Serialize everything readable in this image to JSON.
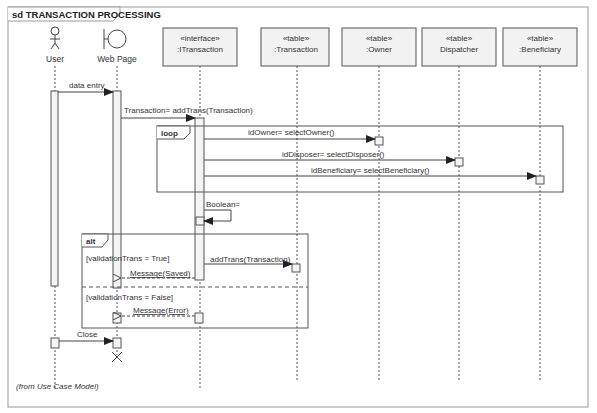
{
  "diagram": {
    "type": "UML sequence diagram",
    "frame_title": "sd TRANSACTION PROCESSING",
    "footer_note": "(from Use Case Model)",
    "participants": [
      {
        "id": "user",
        "kind": "actor",
        "label": "User"
      },
      {
        "id": "webpage",
        "kind": "boundary",
        "label": "Web Page"
      },
      {
        "id": "itransaction",
        "kind": "box",
        "stereotype": "«interface»",
        "label": ":ITransaction"
      },
      {
        "id": "transaction",
        "kind": "box",
        "stereotype": "«table»",
        "label": ":Transaction"
      },
      {
        "id": "owner",
        "kind": "box",
        "stereotype": "«table»",
        "label": ":Owner"
      },
      {
        "id": "dispatcher",
        "kind": "box",
        "stereotype": "«table»",
        "label": "Dispatcher"
      },
      {
        "id": "beneficiary",
        "kind": "box",
        "stereotype": "«table»",
        "label": ":Beneficiary"
      }
    ],
    "messages": [
      {
        "from": "User",
        "to": "Web Page",
        "label": "data entry",
        "style": "sync"
      },
      {
        "from": "Web Page",
        "to": ":ITransaction",
        "label": "Transaction= addTrans(Transaction)",
        "style": "sync"
      },
      {
        "from": ":ITransaction",
        "to": ":Owner",
        "label": "idOwner= selectOwner()",
        "style": "sync"
      },
      {
        "from": ":ITransaction",
        "to": "Dispatcher",
        "label": "idDisposer= selectDisposer()",
        "style": "sync"
      },
      {
        "from": ":ITransaction",
        "to": ":Beneficiary",
        "label": "idBeneficiary= selectBeneficiary()",
        "style": "sync"
      },
      {
        "from": ":ITransaction",
        "to": ":ITransaction",
        "label": "Boolean=",
        "style": "self"
      },
      {
        "from": ":ITransaction",
        "to": ":Transaction",
        "label": "addTrans(Transaction)",
        "style": "sync"
      },
      {
        "from": ":ITransaction",
        "to": "Web Page",
        "label": "Message(Saved)",
        "style": "return"
      },
      {
        "from": ":ITransaction",
        "to": "Web Page",
        "label": "Message(Error)",
        "style": "return"
      },
      {
        "from": "User",
        "to": "Web Page",
        "label": "Close",
        "style": "sync"
      }
    ],
    "fragments": [
      {
        "operator": "loop",
        "guards": []
      },
      {
        "operator": "alt",
        "guards": [
          "[validationTrans = True]",
          "[validationTrans = False]"
        ]
      }
    ]
  }
}
